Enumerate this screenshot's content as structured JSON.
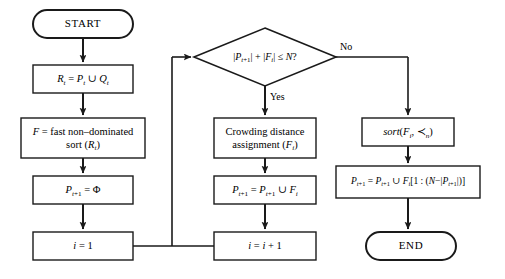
{
  "diagram": {
    "type": "flowchart",
    "stroke_color": "#1a1a1a",
    "fill_color": "#ffffff",
    "text_color": "#000000"
  },
  "nodes": {
    "start": {
      "label": "START",
      "shape": "terminator"
    },
    "union": {
      "label": "R_t = P_t ∪ Q_t",
      "shape": "process"
    },
    "sort": {
      "label_line1": "F = fast non–dominated",
      "label_line2": "sort (R_t)",
      "shape": "process"
    },
    "init_pop": {
      "label": "P_t+1 = Φ",
      "shape": "process"
    },
    "init_i": {
      "label": "i = 1",
      "shape": "process"
    },
    "decision": {
      "label": "|P_t+1| + |F_i| ≤ N?",
      "shape": "decision",
      "yes_label": "Yes",
      "no_label": "No"
    },
    "crowding": {
      "label_line1": "Crowding distance",
      "label_line2": "assignment (F_i)",
      "shape": "process"
    },
    "accumulate": {
      "label": "P_t+1 = P_t+1 ∪ F_i",
      "shape": "process"
    },
    "increment": {
      "label": "i = i + 1",
      "shape": "process"
    },
    "sort_crowded": {
      "label": "sort(F_i, ≺_n)",
      "shape": "process"
    },
    "fill_rest": {
      "label": "P_t+1 = P_t+1 ∪ F_i[1 : (N−|P_t+1|)]",
      "shape": "process"
    },
    "end": {
      "label": "END",
      "shape": "terminator"
    }
  }
}
